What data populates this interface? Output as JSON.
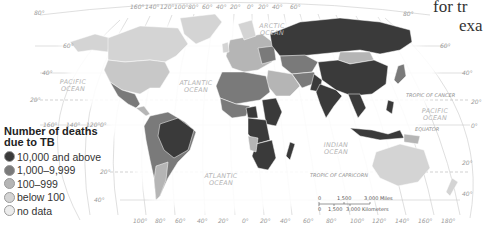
{
  "legend": {
    "title_line1": "Number of deaths",
    "title_line2": "due to TB",
    "items": [
      {
        "label": "10,000 and above",
        "color": "#3a3a3a"
      },
      {
        "label": "1,000–9,999",
        "color": "#7a7a7a"
      },
      {
        "label": "100–999",
        "color": "#b5b5b5"
      },
      {
        "label": "below 100",
        "color": "#d4d4d4"
      },
      {
        "label": "no data",
        "color": "#ececec"
      }
    ]
  },
  "caption": {
    "line1": "for tr",
    "line2": "exa"
  },
  "oceans": {
    "arctic_1": "ARCTIC",
    "arctic_2": "OCEAN",
    "pacific_w_1": "PACIFIC",
    "pacific_w_2": "OCEAN",
    "atlantic_n_1": "ATLANTIC",
    "atlantic_n_2": "OCEAN",
    "atlantic_s_1": "ATLANTIC",
    "atlantic_s_2": "OCEAN",
    "indian_1": "INDIAN",
    "indian_2": "OCEAN",
    "pacific_e_1": "PACIFIC",
    "pacific_e_2": "OCEAN"
  },
  "lines": {
    "tropic_cancer": "TROPIC OF CANCER",
    "equator": "EQUATOR",
    "tropic_capricorn": "TROPIC OF CAPRICORN"
  },
  "latitudes": {
    "lat80": "80°",
    "lat60": "60°",
    "lat40n": "40°",
    "lat20n": "20°",
    "lat0": "0°",
    "lat20s": "20°",
    "lat40s": "40°",
    "r_lat60": "60°",
    "r_lat40n": "40°",
    "r_lat20n": "20°",
    "r_lat0": "0°",
    "r_lat20s": "20°",
    "r_lat40s": "40°",
    "r_lat80": "80°"
  },
  "longitudes_top": [
    "160°",
    "140°",
    "120°",
    "100°",
    "80°",
    "60°",
    "40°",
    "20°",
    "0°",
    "20°",
    "40°",
    "60°",
    "80°",
    "100°",
    "120°",
    "140°",
    "160°",
    "180°"
  ],
  "longitudes_mid": [
    "160°",
    "140°",
    "120°"
  ],
  "longitudes_bottom": [
    "100°",
    "80°",
    "60°",
    "40°",
    "20°",
    "0°",
    "20°",
    "40°",
    "60°",
    "80°",
    "100°",
    "120°",
    "140°",
    "160°",
    "180°"
  ],
  "scale_bar": {
    "miles_0": "0",
    "miles_1": "1,500",
    "miles_2": "3,000 Miles",
    "km_0": "0",
    "km_1": "1,500",
    "km_2": "3,000 Kilometers"
  },
  "map_colors": {
    "very_high": "#3a3a3a",
    "high": "#7a7a7a",
    "medium": "#b5b5b5",
    "low": "#d4d4d4",
    "no_data": "#ececec"
  }
}
